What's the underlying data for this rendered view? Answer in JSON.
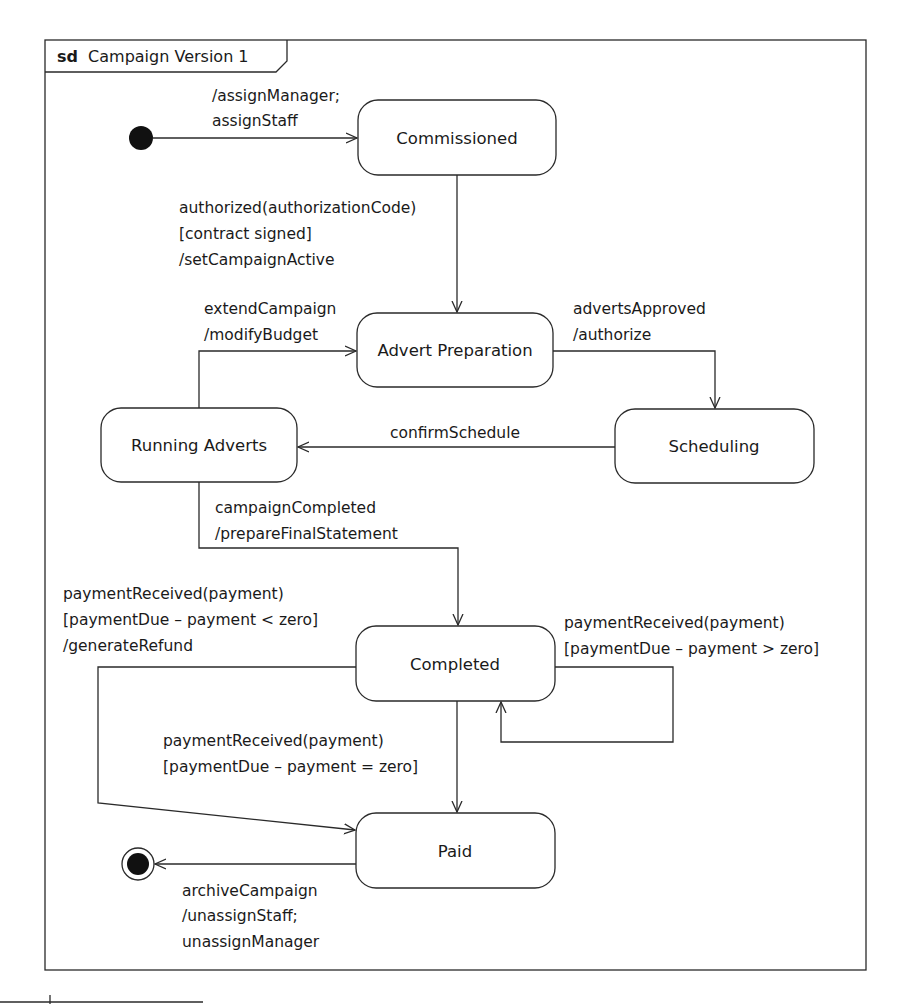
{
  "frame": {
    "keyword": "sd",
    "title": "Campaign Version 1"
  },
  "states": {
    "commissioned": "Commissioned",
    "advert_preparation": "Advert Preparation",
    "scheduling": "Scheduling",
    "running_adverts": "Running Adverts",
    "completed": "Completed",
    "paid": "Paid"
  },
  "transitions": {
    "initial_to_commissioned": [
      "/assignManager;",
      "assignStaff"
    ],
    "commissioned_to_advert_preparation": [
      "authorized(authorizationCode)",
      "[contract signed]",
      "/setCampaignActive"
    ],
    "running_to_advert_preparation": [
      "extendCampaign",
      "/modifyBudget"
    ],
    "advert_preparation_to_scheduling": [
      "advertsApproved",
      "/authorize"
    ],
    "scheduling_to_running": [
      "confirmSchedule"
    ],
    "running_to_completed": [
      "campaignCompleted",
      "/prepareFinalStatement"
    ],
    "completed_to_paid_refund": [
      "paymentReceived(payment)",
      "[paymentDue – payment < zero]",
      "/generateRefund"
    ],
    "completed_self": [
      "paymentReceived(payment)",
      "[paymentDue – payment > zero]"
    ],
    "completed_to_paid_exact": [
      "paymentReceived(payment)",
      "[paymentDue – payment = zero]"
    ],
    "paid_to_final": [
      "archiveCampaign",
      "/unassignStaff;",
      "unassignManager"
    ]
  },
  "colors": {
    "line": "#2a2a2a",
    "text": "#1a1a1a",
    "background": "#ffffff"
  }
}
